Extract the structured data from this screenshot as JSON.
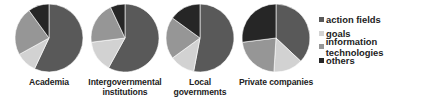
{
  "chart_data": {
    "type": "pie",
    "title": "",
    "legend_position": "right",
    "series_labels": [
      "action fields",
      "goals",
      "information technologies",
      "others"
    ],
    "colors": [
      "#595959",
      "#d2d2d2",
      "#969696",
      "#262626"
    ],
    "charts": [
      {
        "category": "Academia",
        "values": [
          57,
          10,
          23,
          10
        ]
      },
      {
        "category": "Intergovernmental institutions",
        "label_lines": [
          "Intergovernmental",
          "institutions"
        ],
        "values": [
          58,
          15,
          20,
          7
        ]
      },
      {
        "category": "Local governments",
        "values": [
          53,
          12,
          20,
          15
        ]
      },
      {
        "category": "Private companies",
        "values": [
          37,
          14,
          22,
          27
        ]
      }
    ]
  },
  "labels": {
    "pie0": "Academia",
    "pie1_line1": "Intergovernmental",
    "pie1_line2": "institutions",
    "pie2": "Local governments",
    "pie3": "Private companies"
  },
  "legend": {
    "items": [
      {
        "label": "action fields",
        "color": "#595959"
      },
      {
        "label": "goals",
        "color": "#d2d2d2"
      },
      {
        "label": "information technologies",
        "color": "#969696"
      },
      {
        "label": "others",
        "color": "#262626"
      }
    ]
  }
}
